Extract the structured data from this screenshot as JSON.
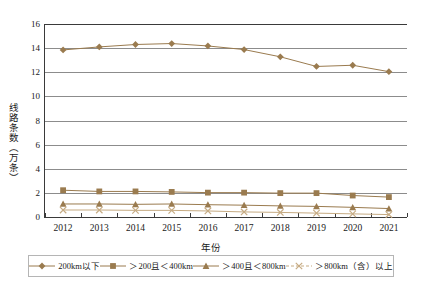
{
  "chart_data": {
    "type": "line",
    "title": "",
    "subtitle": "",
    "xlabel": "年份",
    "ylabel": "线路条数（万条）",
    "categories": [
      "2012",
      "2013",
      "2014",
      "2015",
      "2016",
      "2017",
      "2018",
      "2019",
      "2020",
      "2021"
    ],
    "ylim": [
      0,
      16
    ],
    "yticks": [
      0,
      2,
      4,
      6,
      8,
      10,
      12,
      14,
      16
    ],
    "grid": true,
    "legend_position": "bottom",
    "series": [
      {
        "name": "200km以下",
        "marker": "diamond",
        "color": "#9a7b4f",
        "values": [
          13.85,
          14.1,
          14.3,
          14.38,
          14.18,
          13.88,
          13.28,
          12.48,
          12.58,
          12.05
        ]
      },
      {
        "name": "≥200且<400km",
        "marker": "square",
        "color": "#9a7b4f",
        "values": [
          2.22,
          2.12,
          2.12,
          2.08,
          2.02,
          2.02,
          1.98,
          1.98,
          1.78,
          1.65
        ]
      },
      {
        "name": "≥400且<800km",
        "marker": "triangle",
        "color": "#9a7b4f",
        "values": [
          1.08,
          1.08,
          1.05,
          1.08,
          1.02,
          0.98,
          0.92,
          0.88,
          0.8,
          0.7
        ]
      },
      {
        "name": "≥800km（含）以上",
        "marker": "cross",
        "color": "#c6ab83",
        "values": [
          0.58,
          0.58,
          0.55,
          0.55,
          0.5,
          0.42,
          0.38,
          0.32,
          0.26,
          0.2
        ]
      }
    ]
  },
  "legend": {
    "items": [
      {
        "label": "200km以下",
        "marker": "diamond",
        "color": "#9a7b4f"
      },
      {
        "label": "＞200且＜400km",
        "marker": "square",
        "color": "#9a7b4f"
      },
      {
        "label": "＞400且＜800km",
        "marker": "triangle",
        "color": "#9a7b4f"
      },
      {
        "label": "＞800km（含）以上",
        "marker": "cross",
        "color": "#c6ab83"
      }
    ]
  },
  "axes": {
    "x_title": "年份",
    "y_title": "线路条数（万条）"
  },
  "colors": {
    "series_primary": "#9a7b4f",
    "series_light": "#c6ab83",
    "gridline": "#8c8c8c",
    "axis": "#3a3a3a",
    "background": "#ffffff"
  }
}
